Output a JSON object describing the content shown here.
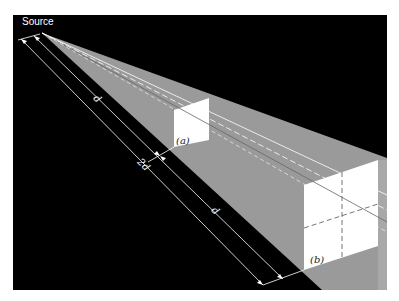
{
  "figure": {
    "colors": {
      "background": "#000000",
      "beam": "#9a9a9a",
      "box_face": "#ffffff",
      "box_side": "#b5b5b5",
      "lines": "#ffffff",
      "dashed": "#555555",
      "page": "#ffffff"
    },
    "labels": {
      "source": "Source",
      "dim_inner_1": "d",
      "dim_outer": "2d",
      "dim_inner_2": "d",
      "box_a": "(a)",
      "box_b": "(b)"
    }
  }
}
